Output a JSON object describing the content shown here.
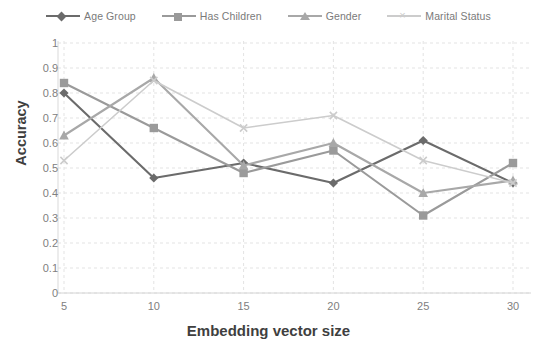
{
  "chart_data": {
    "type": "line",
    "title": "",
    "xlabel": "Embedding vector size",
    "ylabel": "Accuracy",
    "x": [
      5,
      10,
      15,
      20,
      25,
      30
    ],
    "xtick_labels": [
      "5",
      "10",
      "15",
      "20",
      "25",
      "30"
    ],
    "ytick_labels": [
      "0",
      "0.1",
      "0.2",
      "0.3",
      "0.4",
      "0.5",
      "0.6",
      "0.7",
      "0.8",
      "0.9",
      "1"
    ],
    "ylim": [
      0,
      1
    ],
    "xlim": [
      5,
      30
    ],
    "grid": true,
    "legend_position": "top",
    "series": [
      {
        "name": "Age Group",
        "marker": "diamond",
        "color": "#6b6b6b",
        "values": [
          0.8,
          0.46,
          0.52,
          0.44,
          0.61,
          0.44
        ]
      },
      {
        "name": "Has Children",
        "marker": "square",
        "color": "#9a9a9a",
        "values": [
          0.84,
          0.66,
          0.48,
          0.57,
          0.31,
          0.52
        ]
      },
      {
        "name": "Gender",
        "marker": "triangle",
        "color": "#a8a8a8",
        "values": [
          0.63,
          0.86,
          0.51,
          0.6,
          0.4,
          0.45
        ]
      },
      {
        "name": "Marital Status",
        "marker": "x",
        "color": "#cccccc",
        "values": [
          0.53,
          0.85,
          0.66,
          0.71,
          0.53,
          0.44
        ]
      }
    ]
  },
  "colors": {
    "axis_text": "#808080",
    "axis_title": "#3f3f3f",
    "grid": "#e3e3e3",
    "background": "#ffffff"
  }
}
